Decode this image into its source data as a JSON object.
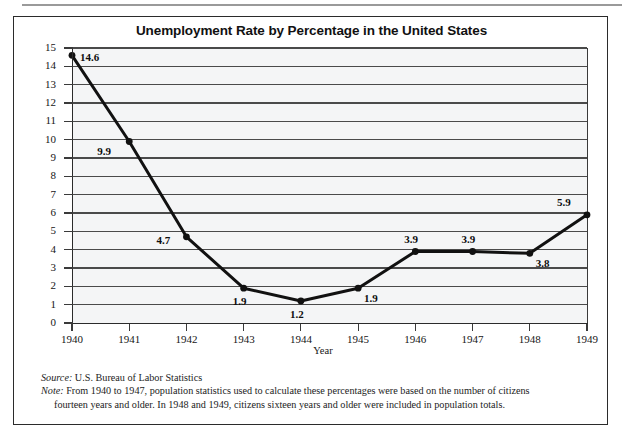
{
  "figure": {
    "title": "Unemployment Rate by Percentage in the United States",
    "source_lead": "Source:",
    "source_text": " U.S. Bureau of Labor Statistics",
    "note_lead": "Note:",
    "note_text": " From 1940 to 1947, population statistics used to calculate these percentages were based on the number of citizens",
    "note_text_cont": "fourteen years and older. In 1948 and 1949, citizens sixteen years and older were included in population totals."
  },
  "chart_data": {
    "type": "line",
    "title": "Unemployment Rate by Percentage in the United States",
    "xlabel": "Year",
    "ylabel": "Percentage",
    "categories": [
      "1940",
      "1941",
      "1942",
      "1943",
      "1944",
      "1945",
      "1946",
      "1947",
      "1948",
      "1949"
    ],
    "values": [
      14.6,
      9.9,
      4.7,
      1.9,
      1.2,
      1.9,
      3.9,
      3.9,
      3.8,
      5.9
    ],
    "point_labels": [
      "14.6",
      "9.9",
      "4.7",
      "1.9",
      "1.2",
      "1.9",
      "3.9",
      "3.9",
      "3.8",
      "5.9"
    ],
    "label_positions": [
      "right",
      "below-left",
      "left",
      "below",
      "below",
      "below-right",
      "above",
      "above",
      "below-right",
      "above-left"
    ],
    "ylim": [
      0,
      15
    ],
    "ytick_labels": [
      "15",
      "14",
      "13",
      "12",
      "11",
      "10",
      "9",
      "8",
      "7",
      "6",
      "5",
      "4",
      "3",
      "2",
      "1",
      "0"
    ],
    "ytick_values": [
      15,
      14,
      13,
      12,
      11,
      10,
      9,
      8,
      7,
      6,
      5,
      4,
      3,
      2,
      1,
      0
    ],
    "grid": true,
    "grid_orientation": "horizontal",
    "legend": false,
    "marker": "filled-circle",
    "line_color": "#111111",
    "plot_background": "#f4f5f6",
    "grid_color": "#4a4a4a"
  }
}
